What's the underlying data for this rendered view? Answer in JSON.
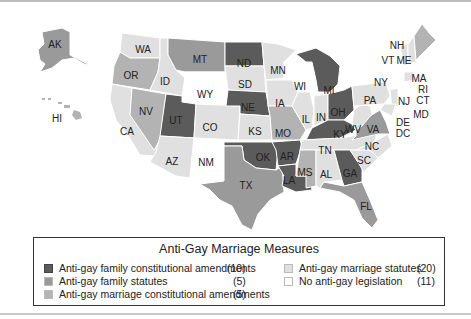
{
  "legend": {
    "title": "Anti-Gay Marriage Measures",
    "items": [
      {
        "label": "Anti-gay family constitutional amendments",
        "count": "(10)",
        "color": "#5b5b5b"
      },
      {
        "label": "Anti-gay family statutes",
        "count": "(5)",
        "color": "#9a9a9a"
      },
      {
        "label": "Anti-gay marriage constitutional amendments",
        "count": "(5)",
        "color": "#b3b3b3"
      },
      {
        "label": "Anti-gay marriage statutes",
        "count": "(20)",
        "color": "#e0e0e0"
      },
      {
        "label": "No anti-gay legislation",
        "count": "(11)",
        "color": "#ffffff"
      }
    ]
  },
  "states": {
    "AK": "AK",
    "HI": "HI",
    "WA": "WA",
    "OR": "OR",
    "CA": "CA",
    "NV": "NV",
    "ID": "ID",
    "MT": "MT",
    "WY": "WY",
    "UT": "UT",
    "AZ": "AZ",
    "CO": "CO",
    "NM": "NM",
    "ND": "ND",
    "SD": "SD",
    "NE": "NE",
    "KS": "KS",
    "OK": "OK",
    "TX": "TX",
    "MN": "MN",
    "IA": "IA",
    "MO": "MO",
    "AR": "AR",
    "LA": "LA",
    "WI": "WI",
    "IL": "IL",
    "MI": "MI",
    "IN": "IN",
    "OH": "OH",
    "KY": "KY",
    "TN": "TN",
    "MS": "MS",
    "AL": "AL",
    "GA": "GA",
    "FL": "FL",
    "SC": "SC",
    "NC": "NC",
    "VA": "VA",
    "WV": "WV",
    "PA": "PA",
    "NY": "NY",
    "VT": "VT",
    "NH": "NH",
    "ME": "ME",
    "MA": "MA",
    "RI": "RI",
    "CT": "CT",
    "NJ": "NJ",
    "DE": "DE",
    "MD": "MD",
    "DC": "DC"
  }
}
